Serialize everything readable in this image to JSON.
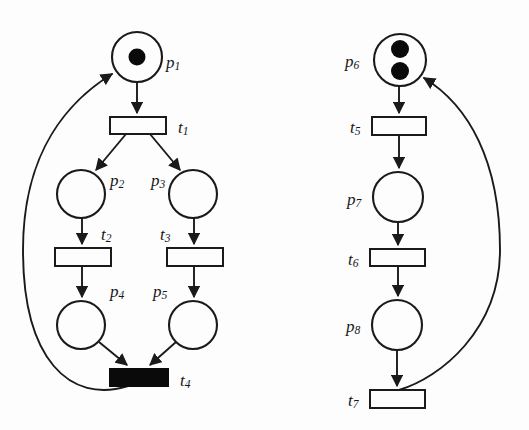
{
  "diagram": {
    "type": "petri-net",
    "background_color": "#fdfdfd",
    "stroke_color": "#1a1a1a",
    "token_color": "#0a0a0a",
    "places": [
      {
        "id": "p1",
        "label": "p",
        "subscript": "1",
        "cx": 137,
        "cy": 57,
        "r": 25,
        "tokens": 1,
        "label_x": 166,
        "label_y": 64
      },
      {
        "id": "p2",
        "label": "p",
        "subscript": "2",
        "cx": 81,
        "cy": 194,
        "r": 24,
        "tokens": 0,
        "label_x": 110,
        "label_y": 182
      },
      {
        "id": "p3",
        "label": "p",
        "subscript": "3",
        "cx": 193,
        "cy": 194,
        "r": 24,
        "tokens": 0,
        "label_x": 151,
        "label_y": 182
      },
      {
        "id": "p4",
        "label": "p",
        "subscript": "4",
        "cx": 81,
        "cy": 325,
        "r": 24,
        "tokens": 0,
        "label_x": 110,
        "label_y": 293
      },
      {
        "id": "p5",
        "label": "p",
        "subscript": "5",
        "cx": 193,
        "cy": 325,
        "r": 24,
        "tokens": 0,
        "label_x": 153,
        "label_y": 293
      },
      {
        "id": "p6",
        "label": "p",
        "subscript": "6",
        "cx": 400,
        "cy": 60,
        "r": 26,
        "tokens": 2,
        "label_x": 345,
        "label_y": 63
      },
      {
        "id": "p7",
        "label": "p",
        "subscript": "7",
        "cx": 398,
        "cy": 197,
        "r": 25,
        "tokens": 0,
        "label_x": 347,
        "label_y": 201
      },
      {
        "id": "p8",
        "label": "p",
        "subscript": "8",
        "cx": 397,
        "cy": 325,
        "r": 25,
        "tokens": 0,
        "label_x": 346,
        "label_y": 328
      }
    ],
    "transitions": [
      {
        "id": "t1",
        "label": "t",
        "subscript": "1",
        "x": 110,
        "y": 117,
        "w": 56,
        "h": 17,
        "filled": false,
        "label_x": 178,
        "label_y": 129
      },
      {
        "id": "t2",
        "label": "t",
        "subscript": "2",
        "x": 55,
        "y": 248,
        "w": 56,
        "h": 18,
        "filled": false,
        "label_x": 101,
        "label_y": 236
      },
      {
        "id": "t3",
        "label": "t",
        "subscript": "3",
        "x": 167,
        "y": 248,
        "w": 56,
        "h": 18,
        "filled": false,
        "label_x": 160,
        "label_y": 236
      },
      {
        "id": "t4",
        "label": "t",
        "subscript": "4",
        "x": 110,
        "y": 369,
        "w": 58,
        "h": 17,
        "filled": true,
        "label_x": 180,
        "label_y": 382
      },
      {
        "id": "t5",
        "label": "t",
        "subscript": "5",
        "x": 372,
        "y": 117,
        "w": 54,
        "h": 18,
        "filled": false,
        "label_x": 350,
        "label_y": 129
      },
      {
        "id": "t6",
        "label": "t",
        "subscript": "6",
        "x": 370,
        "y": 249,
        "w": 55,
        "h": 17,
        "filled": false,
        "label_x": 348,
        "label_y": 261
      },
      {
        "id": "t7",
        "label": "t",
        "subscript": "7",
        "x": 370,
        "y": 390,
        "w": 55,
        "h": 18,
        "filled": false,
        "label_x": 348,
        "label_y": 402
      }
    ],
    "arcs": [
      {
        "id": "arc-p1-t1",
        "from": "p1",
        "to": "t1",
        "kind": "straight",
        "path": "M 137 82 L 137 113"
      },
      {
        "id": "arc-t1-p2",
        "from": "t1",
        "to": "p2",
        "kind": "straight",
        "path": "M 126 134 L 96 170"
      },
      {
        "id": "arc-t1-p3",
        "from": "t1",
        "to": "p3",
        "kind": "straight",
        "path": "M 150 134 L 180 170"
      },
      {
        "id": "arc-p2-t2",
        "from": "p2",
        "to": "t2",
        "kind": "straight",
        "path": "M 82 218 L 82 244"
      },
      {
        "id": "arc-p3-t3",
        "from": "p3",
        "to": "t3",
        "kind": "straight",
        "path": "M 194 218 L 194 244"
      },
      {
        "id": "arc-t2-p4",
        "from": "t2",
        "to": "p4",
        "kind": "straight",
        "path": "M 82 266 L 82 297"
      },
      {
        "id": "arc-t3-p5",
        "from": "t3",
        "to": "p5",
        "kind": "straight",
        "path": "M 194 266 L 194 297"
      },
      {
        "id": "arc-p4-t4",
        "from": "p4",
        "to": "t4",
        "kind": "straight",
        "path": "M 99 342 L 127 365"
      },
      {
        "id": "arc-p5-t4",
        "from": "p5",
        "to": "t4",
        "kind": "straight",
        "path": "M 176 342 L 150 365"
      },
      {
        "id": "arc-t4-p1",
        "from": "t4",
        "to": "p1",
        "kind": "curve",
        "path": "M 128 386 C 70 404 23 360 23 250 C 23 150 70 100 112 74"
      },
      {
        "id": "arc-p6-t5",
        "from": "p6",
        "to": "t5",
        "kind": "straight",
        "path": "M 399 86 L 399 113"
      },
      {
        "id": "arc-t5-p7",
        "from": "t5",
        "to": "p7",
        "kind": "straight",
        "path": "M 399 135 L 399 168"
      },
      {
        "id": "arc-p7-t6",
        "from": "p7",
        "to": "t6",
        "kind": "straight",
        "path": "M 398 222 L 398 245"
      },
      {
        "id": "arc-t6-p8",
        "from": "t6",
        "to": "p8",
        "kind": "straight",
        "path": "M 398 266 L 398 296"
      },
      {
        "id": "arc-p8-t7",
        "from": "p8",
        "to": "t7",
        "kind": "straight",
        "path": "M 397 350 L 397 386"
      },
      {
        "id": "arc-t7-p6",
        "from": "t7",
        "to": "p6",
        "kind": "curve",
        "path": "M 399 390 C 440 378 500 330 500 250 C 500 160 468 105 424 78"
      }
    ]
  }
}
